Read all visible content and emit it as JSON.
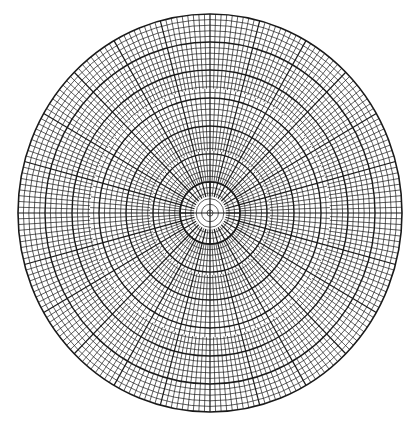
{
  "figure": {
    "type": "polar-grid",
    "background": "#ffffff",
    "line_color": "#1a1a1a",
    "center": [
      210,
      213
    ],
    "outer_radius_x": 192,
    "outer_radius_y": 199,
    "ring_spacing": 5.4,
    "bold_ring_every": 5,
    "inner_plain_radius": 16,
    "inner_ring_radius": 30,
    "zones": [
      {
        "r_from": 16,
        "r_to": 30,
        "radials": 48
      },
      {
        "r_from": 30,
        "r_to": 60,
        "radials": 96
      },
      {
        "r_from": 60,
        "r_to": 120,
        "radials": 144
      },
      {
        "r_from": 120,
        "r_to": 200,
        "radials": 216
      }
    ],
    "bold_radials_every_deg": 15,
    "crosshair": true
  }
}
